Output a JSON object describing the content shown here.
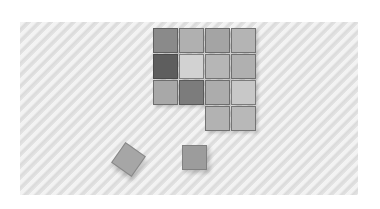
{
  "image": {
    "description": "Photograph of gray-toned wooden cubes on a wavy white-gray textured surface",
    "grid": {
      "rows": [
        [
          "#8a8a8a",
          "#b0b0b0",
          "#a4a4a4",
          "#b4b4b4"
        ],
        [
          "#5e5e5e",
          "#d2d2d2",
          "#b6b6b6",
          "#b0b0b0"
        ],
        [
          "#a8a8a8",
          "#7c7c7c",
          "#acacac",
          "#c8c8c8"
        ],
        [
          null,
          null,
          "#b2b2b2",
          "#b8b8b8"
        ]
      ]
    },
    "loose_cubes": [
      {
        "color": "#a6a6a6",
        "rotated": true
      },
      {
        "color": "#9c9c9c",
        "rotated": false
      }
    ]
  }
}
